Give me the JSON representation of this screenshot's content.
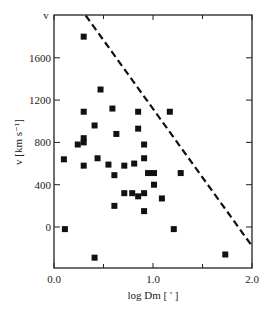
{
  "chart_data": {
    "type": "scatter",
    "title": "",
    "xlabel": "log Dm [ ' ]",
    "ylabel": "v [km s⁻¹]",
    "y_top_label": "v",
    "xlim": [
      0.0,
      2.0
    ],
    "ylim": [
      -390,
      2000
    ],
    "x_ticks": [
      0.0,
      1.0,
      2.0
    ],
    "x_tick_labels": [
      "0.0",
      "1.0",
      "2.0"
    ],
    "x_minor_ticks": [
      0.5,
      1.5
    ],
    "y_ticks": [
      0,
      400,
      800,
      1200,
      1600
    ],
    "y_tick_labels": [
      "0",
      "400",
      "800",
      "1200",
      "1600"
    ],
    "grid": false,
    "legend": null,
    "marker": "filled-square",
    "series": [
      {
        "name": "galaxies",
        "points": [
          [
            0.3,
            1800
          ],
          [
            0.47,
            1300
          ],
          [
            0.3,
            1090
          ],
          [
            0.59,
            1120
          ],
          [
            0.41,
            960
          ],
          [
            0.63,
            880
          ],
          [
            0.24,
            780
          ],
          [
            0.3,
            800
          ],
          [
            0.3,
            840
          ],
          [
            0.1,
            640
          ],
          [
            0.3,
            580
          ],
          [
            0.44,
            650
          ],
          [
            0.55,
            590
          ],
          [
            0.61,
            490
          ],
          [
            0.71,
            580
          ],
          [
            0.81,
            600
          ],
          [
            0.85,
            1090
          ],
          [
            1.17,
            1090
          ],
          [
            0.85,
            930
          ],
          [
            0.91,
            780
          ],
          [
            0.91,
            650
          ],
          [
            0.95,
            510
          ],
          [
            1.01,
            510
          ],
          [
            1.28,
            510
          ],
          [
            0.71,
            320
          ],
          [
            0.79,
            320
          ],
          [
            0.85,
            290
          ],
          [
            0.91,
            320
          ],
          [
            1.01,
            400
          ],
          [
            1.09,
            270
          ],
          [
            0.61,
            200
          ],
          [
            0.91,
            150
          ],
          [
            1.21,
            -20
          ],
          [
            0.11,
            -20
          ],
          [
            0.41,
            -290
          ],
          [
            1.73,
            -260
          ]
        ]
      }
    ],
    "annotations": [
      {
        "type": "dashed-line",
        "from": [
          0.32,
          2000
        ],
        "to": [
          2.0,
          -180
        ]
      }
    ]
  }
}
